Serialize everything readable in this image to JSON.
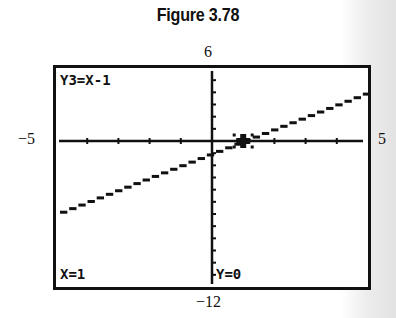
{
  "figure": {
    "title": "Figure 3.78"
  },
  "window": {
    "ymax_label": "6",
    "ymin_label": "−12",
    "xmin_label": "−5",
    "xmax_label": "5"
  },
  "screen": {
    "equation": "Y3=X-1",
    "cursor_x": "X=1",
    "cursor_y": "Y=0"
  },
  "chart_data": {
    "type": "line",
    "title": "Figure 3.78",
    "subtitle": "Graphing calculator screen",
    "series": [
      {
        "name": "Y3=X-1",
        "x": [
          -5,
          5
        ],
        "y": [
          -6,
          4
        ]
      }
    ],
    "annotations": [
      "Y3=X-1",
      "X=1",
      "Y=0"
    ],
    "trace_point": {
      "x": 1,
      "y": 0
    },
    "xlim": [
      -5,
      5
    ],
    "ylim": [
      -12,
      6
    ],
    "xlabel": "",
    "ylabel": "",
    "grid": false,
    "x_tick_spacing": 1,
    "y_tick_spacing": 1
  }
}
